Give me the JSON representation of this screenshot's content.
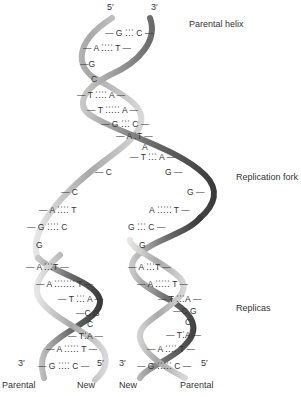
{
  "labels": {
    "parental_helix": "Parental helix",
    "replication_fork": "Replication fork",
    "replicas": "Replicas"
  },
  "ends": {
    "top_left": "5′",
    "top_right": "3′",
    "left_replica_bottom_left": "3′",
    "left_replica_bottom_right": "5′",
    "right_replica_bottom_left": "3′",
    "right_replica_bottom_right": "5′"
  },
  "bottom_labels": {
    "left_replica_left": "Parental",
    "left_replica_right": "New",
    "right_replica_left": "New",
    "right_replica_right": "Parental"
  },
  "parental_helix_pairs": [
    {
      "text": "— G ⁚⁚⁚ C —"
    },
    {
      "text": "— A ⁚⁚⁚⁚ T —"
    },
    {
      "text": "—G"
    },
    {
      "text": "C"
    },
    {
      "text": "— T ⁚⁚⁚⁚ A —"
    },
    {
      "text": "— T ⁚⁚⁚⁚⁚ A —"
    },
    {
      "text": "— G ⁚⁚⁚ C —"
    },
    {
      "text": "— A ⁚T —"
    },
    {
      "text": "A"
    },
    {
      "text": "— T ⁚⁚⁚ A —"
    }
  ],
  "fork_left_strand": [
    {
      "text": "— C"
    },
    {
      "text": "— C"
    }
  ],
  "fork_right_strand": [
    {
      "text": "G —"
    },
    {
      "text": "G —"
    }
  ],
  "left_replica_pairs": [
    {
      "text": "— A ⁚⁚⁚⁚ T"
    },
    {
      "text": "— G ⁚⁚⁚⁚ C"
    },
    {
      "text": "G"
    },
    {
      "text": "— A ⁚⁚⁚T —"
    },
    {
      "text": "— A ⁚⁚⁚⁚⁚⁚⁚ T —"
    },
    {
      "text": "— T ⁚⁚⁚ A —"
    },
    {
      "text": "—C G"
    },
    {
      "text": "C"
    },
    {
      "text": "— T⁚A —"
    },
    {
      "text": "— A ⁚⁚⁚⁚⁚ T —"
    },
    {
      "text": "— G ⁚⁚⁚⁚ C —"
    }
  ],
  "right_replica_pairs": [
    {
      "text": "A ⁚⁚⁚⁚⁚ T —"
    },
    {
      "text": "G ⁚⁚⁚ C —"
    },
    {
      "text": "G"
    },
    {
      "text": "— A ⁚⁚⁚T —"
    },
    {
      "text": "— A ⁚⁚⁚⁚⁚ T —"
    },
    {
      "text": "— T ⁚⁚⁚A —"
    },
    {
      "text": "—C G"
    },
    {
      "text": "C"
    },
    {
      "text": "— T⁚A —"
    },
    {
      "text": "— A ⁚⁚⁚⁚ T —"
    },
    {
      "text": "— G ⁚⁚⁚⁚⁚ C —"
    }
  ]
}
